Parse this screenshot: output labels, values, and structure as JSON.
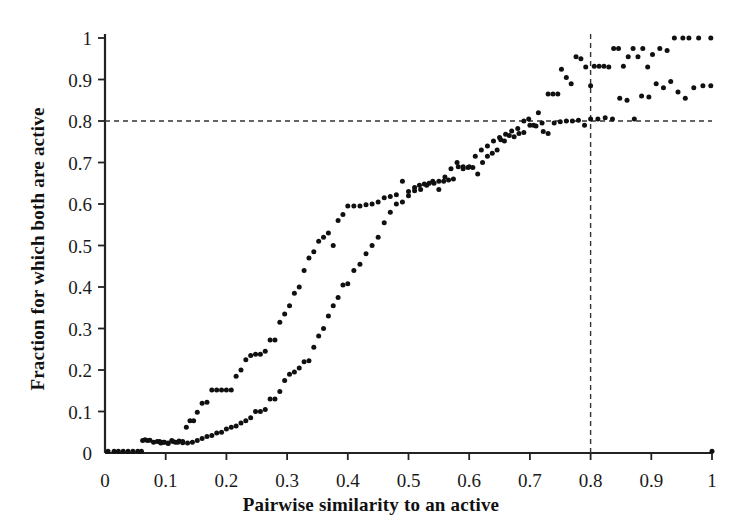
{
  "chart_data": {
    "type": "scatter",
    "title": "",
    "xlabel": "Pairwise similarity to an active",
    "ylabel": "Fraction for which both are active",
    "xlim": [
      0,
      1
    ],
    "ylim": [
      0,
      1
    ],
    "grid": false,
    "legend": null,
    "xticks": [
      "0",
      "0.1",
      "0.2",
      "0.3",
      "0.4",
      "0.5",
      "0.6",
      "0.7",
      "0.8",
      "0.9",
      "1"
    ],
    "xtick_values": [
      0,
      0.1,
      0.2,
      0.3,
      0.4,
      0.5,
      0.6,
      0.7,
      0.8,
      0.9,
      1
    ],
    "yticks": [
      "0",
      "0.1",
      "0.2",
      "0.3",
      "0.4",
      "0.5",
      "0.6",
      "0.7",
      "0.8",
      "0.9",
      "1"
    ],
    "ytick_values": [
      0,
      0.1,
      0.2,
      0.3,
      0.4,
      0.5,
      0.6,
      0.7,
      0.8,
      0.9,
      1
    ],
    "marker": {
      "shape": "circle",
      "size_px": 5,
      "color": "#101010"
    },
    "reference_lines": [
      {
        "name": "horizontal-threshold",
        "orientation": "horizontal",
        "value": 0.8,
        "style": "dashed",
        "color": "#333333"
      },
      {
        "name": "vertical-threshold",
        "orientation": "vertical",
        "value": 0.8,
        "style": "dashed",
        "color": "#333333"
      }
    ],
    "series": [
      {
        "name": "upper-curve",
        "points": [
          [
            0.005,
            0.004
          ],
          [
            0.015,
            0.004
          ],
          [
            0.022,
            0.004
          ],
          [
            0.03,
            0.004
          ],
          [
            0.038,
            0.004
          ],
          [
            0.046,
            0.004
          ],
          [
            0.054,
            0.004
          ],
          [
            0.062,
            0.03
          ],
          [
            0.066,
            0.032
          ],
          [
            0.07,
            0.03
          ],
          [
            0.074,
            0.031
          ],
          [
            0.08,
            0.026
          ],
          [
            0.086,
            0.028
          ],
          [
            0.092,
            0.024
          ],
          [
            0.098,
            0.026
          ],
          [
            0.104,
            0.023
          ],
          [
            0.11,
            0.03
          ],
          [
            0.116,
            0.026
          ],
          [
            0.122,
            0.029
          ],
          [
            0.128,
            0.025
          ],
          [
            0.134,
            0.062
          ],
          [
            0.14,
            0.078
          ],
          [
            0.146,
            0.078
          ],
          [
            0.152,
            0.098
          ],
          [
            0.16,
            0.12
          ],
          [
            0.168,
            0.122
          ],
          [
            0.176,
            0.152
          ],
          [
            0.184,
            0.152
          ],
          [
            0.192,
            0.152
          ],
          [
            0.2,
            0.152
          ],
          [
            0.208,
            0.152
          ],
          [
            0.216,
            0.185
          ],
          [
            0.224,
            0.2
          ],
          [
            0.232,
            0.225
          ],
          [
            0.24,
            0.235
          ],
          [
            0.248,
            0.238
          ],
          [
            0.256,
            0.238
          ],
          [
            0.264,
            0.245
          ],
          [
            0.272,
            0.272
          ],
          [
            0.28,
            0.272
          ],
          [
            0.288,
            0.315
          ],
          [
            0.296,
            0.335
          ],
          [
            0.304,
            0.355
          ],
          [
            0.312,
            0.385
          ],
          [
            0.32,
            0.4
          ],
          [
            0.328,
            0.44
          ],
          [
            0.336,
            0.47
          ],
          [
            0.344,
            0.485
          ],
          [
            0.352,
            0.51
          ],
          [
            0.36,
            0.52
          ],
          [
            0.368,
            0.53
          ],
          [
            0.376,
            0.5
          ],
          [
            0.384,
            0.56
          ],
          [
            0.392,
            0.575
          ],
          [
            0.4,
            0.595
          ],
          [
            0.41,
            0.595
          ],
          [
            0.42,
            0.595
          ],
          [
            0.43,
            0.598
          ],
          [
            0.44,
            0.6
          ],
          [
            0.45,
            0.605
          ],
          [
            0.46,
            0.615
          ],
          [
            0.47,
            0.618
          ],
          [
            0.48,
            0.622
          ],
          [
            0.49,
            0.655
          ],
          [
            0.5,
            0.63
          ],
          [
            0.51,
            0.64
          ],
          [
            0.518,
            0.645
          ],
          [
            0.526,
            0.648
          ],
          [
            0.534,
            0.65
          ],
          [
            0.542,
            0.65
          ],
          [
            0.55,
            0.635
          ],
          [
            0.558,
            0.655
          ],
          [
            0.566,
            0.658
          ],
          [
            0.574,
            0.66
          ],
          [
            0.582,
            0.69
          ],
          [
            0.59,
            0.685
          ],
          [
            0.598,
            0.688
          ],
          [
            0.606,
            0.688
          ],
          [
            0.614,
            0.672
          ],
          [
            0.622,
            0.7
          ],
          [
            0.63,
            0.715
          ],
          [
            0.638,
            0.722
          ],
          [
            0.646,
            0.73
          ],
          [
            0.652,
            0.755
          ],
          [
            0.658,
            0.752
          ],
          [
            0.666,
            0.765
          ],
          [
            0.674,
            0.762
          ],
          [
            0.682,
            0.77
          ],
          [
            0.69,
            0.772
          ],
          [
            0.698,
            0.805
          ],
          [
            0.706,
            0.79
          ],
          [
            0.714,
            0.82
          ],
          [
            0.722,
            0.775
          ],
          [
            0.73,
            0.865
          ],
          [
            0.738,
            0.865
          ],
          [
            0.746,
            0.865
          ],
          [
            0.752,
            0.925
          ],
          [
            0.76,
            0.905
          ],
          [
            0.768,
            0.89
          ],
          [
            0.776,
            0.955
          ],
          [
            0.784,
            0.95
          ],
          [
            0.792,
            0.93
          ],
          [
            0.8,
            0.885
          ],
          [
            0.806,
            0.932
          ],
          [
            0.814,
            0.932
          ],
          [
            0.822,
            0.932
          ],
          [
            0.83,
            0.93
          ],
          [
            0.838,
            0.975
          ],
          [
            0.846,
            0.975
          ],
          [
            0.854,
            0.932
          ],
          [
            0.862,
            0.955
          ],
          [
            0.87,
            0.975
          ],
          [
            0.878,
            0.955
          ],
          [
            0.886,
            0.975
          ],
          [
            0.894,
            0.93
          ],
          [
            0.902,
            0.96
          ],
          [
            0.914,
            0.975
          ],
          [
            0.926,
            0.97
          ],
          [
            0.938,
            1.0
          ],
          [
            0.952,
            1.0
          ],
          [
            0.962,
            1.0
          ],
          [
            0.978,
            1.0
          ],
          [
            0.998,
            1.0
          ]
        ]
      },
      {
        "name": "lower-curve",
        "points": [
          [
            0.06,
            0.004
          ],
          [
            0.09,
            0.028
          ],
          [
            0.096,
            0.026
          ],
          [
            0.104,
            0.024
          ],
          [
            0.112,
            0.028
          ],
          [
            0.12,
            0.026
          ],
          [
            0.128,
            0.028
          ],
          [
            0.136,
            0.024
          ],
          [
            0.144,
            0.026
          ],
          [
            0.152,
            0.03
          ],
          [
            0.16,
            0.035
          ],
          [
            0.168,
            0.04
          ],
          [
            0.176,
            0.042
          ],
          [
            0.184,
            0.048
          ],
          [
            0.192,
            0.05
          ],
          [
            0.2,
            0.058
          ],
          [
            0.208,
            0.062
          ],
          [
            0.216,
            0.065
          ],
          [
            0.224,
            0.072
          ],
          [
            0.232,
            0.078
          ],
          [
            0.24,
            0.085
          ],
          [
            0.248,
            0.1
          ],
          [
            0.256,
            0.1
          ],
          [
            0.264,
            0.105
          ],
          [
            0.272,
            0.13
          ],
          [
            0.28,
            0.13
          ],
          [
            0.288,
            0.148
          ],
          [
            0.296,
            0.175
          ],
          [
            0.304,
            0.19
          ],
          [
            0.312,
            0.195
          ],
          [
            0.32,
            0.205
          ],
          [
            0.328,
            0.22
          ],
          [
            0.336,
            0.222
          ],
          [
            0.344,
            0.255
          ],
          [
            0.352,
            0.282
          ],
          [
            0.36,
            0.3
          ],
          [
            0.368,
            0.33
          ],
          [
            0.376,
            0.355
          ],
          [
            0.384,
            0.375
          ],
          [
            0.392,
            0.405
          ],
          [
            0.4,
            0.408
          ],
          [
            0.41,
            0.44
          ],
          [
            0.42,
            0.455
          ],
          [
            0.43,
            0.48
          ],
          [
            0.44,
            0.5
          ],
          [
            0.45,
            0.52
          ],
          [
            0.46,
            0.555
          ],
          [
            0.47,
            0.58
          ],
          [
            0.48,
            0.6
          ],
          [
            0.49,
            0.605
          ],
          [
            0.5,
            0.62
          ],
          [
            0.51,
            0.632
          ],
          [
            0.52,
            0.635
          ],
          [
            0.53,
            0.645
          ],
          [
            0.54,
            0.655
          ],
          [
            0.55,
            0.655
          ],
          [
            0.56,
            0.665
          ],
          [
            0.57,
            0.685
          ],
          [
            0.58,
            0.7
          ],
          [
            0.59,
            0.69
          ],
          [
            0.6,
            0.69
          ],
          [
            0.61,
            0.715
          ],
          [
            0.62,
            0.73
          ],
          [
            0.63,
            0.74
          ],
          [
            0.64,
            0.752
          ],
          [
            0.65,
            0.76
          ],
          [
            0.66,
            0.768
          ],
          [
            0.67,
            0.776
          ],
          [
            0.68,
            0.782
          ],
          [
            0.69,
            0.8
          ],
          [
            0.7,
            0.79
          ],
          [
            0.71,
            0.788
          ],
          [
            0.72,
            0.795
          ],
          [
            0.73,
            0.77
          ],
          [
            0.74,
            0.795
          ],
          [
            0.75,
            0.798
          ],
          [
            0.76,
            0.8
          ],
          [
            0.77,
            0.8
          ],
          [
            0.78,
            0.802
          ],
          [
            0.79,
            0.79
          ],
          [
            0.8,
            0.805
          ],
          [
            0.812,
            0.805
          ],
          [
            0.824,
            0.808
          ],
          [
            0.836,
            0.805
          ],
          [
            0.848,
            0.855
          ],
          [
            0.86,
            0.85
          ],
          [
            0.872,
            0.805
          ],
          [
            0.884,
            0.86
          ],
          [
            0.896,
            0.858
          ],
          [
            0.908,
            0.89
          ],
          [
            0.92,
            0.88
          ],
          [
            0.932,
            0.895
          ],
          [
            0.944,
            0.87
          ],
          [
            0.956,
            0.855
          ],
          [
            0.97,
            0.88
          ],
          [
            0.985,
            0.885
          ],
          [
            0.998,
            0.885
          ]
        ]
      },
      {
        "name": "baseline-zero-point",
        "points": [
          [
            1.0,
            0.004
          ]
        ]
      }
    ]
  },
  "axes": {
    "x_title": "Pairwise similarity to an active",
    "y_title": "Fraction for which both are active"
  }
}
